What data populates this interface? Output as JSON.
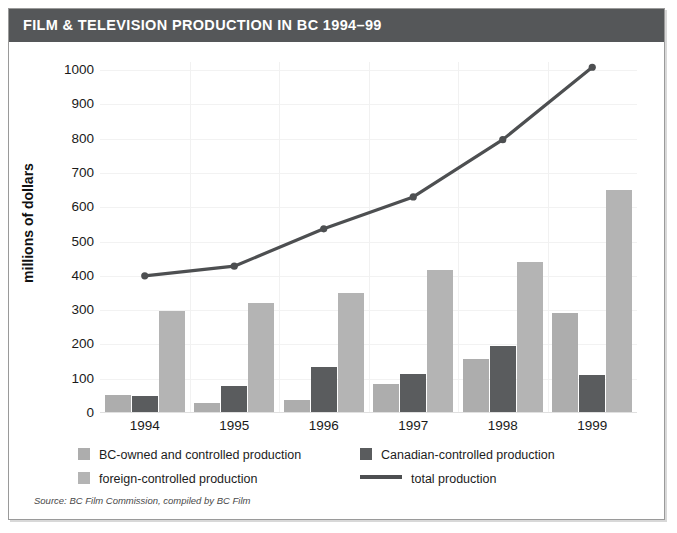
{
  "title": "FILM & TELEVISION PRODUCTION IN BC 1994–99",
  "source_note": "Source: BC Film Commission, compiled by BC Film",
  "colors": {
    "banner": "#555759",
    "banner_text": "#ffffff",
    "bc_owned": "#adadad",
    "canadian": "#5a5c5e",
    "foreign": "#b4b4b4",
    "total_line": "#4d4f51",
    "frame": "#9a9a9a",
    "gridline": "#f2f2f2"
  },
  "legend": {
    "items": [
      {
        "label": "BC-owned and controlled production",
        "type": "swatch",
        "color": "#adadad"
      },
      {
        "label": "Canadian-controlled production",
        "type": "swatch",
        "color": "#5a5c5e"
      },
      {
        "label": "foreign-controlled production",
        "type": "swatch",
        "color": "#b4b4b4"
      },
      {
        "label": "total production",
        "type": "line",
        "color": "#4d4f51"
      }
    ]
  },
  "chart_data": {
    "type": "bar",
    "title": "FILM & TELEVISION PRODUCTION IN BC 1994–99",
    "subtitle": "",
    "xlabel": "",
    "ylabel": "millions of dollars",
    "categories": [
      "1994",
      "1995",
      "1996",
      "1997",
      "1998",
      "1999"
    ],
    "ylim": [
      0,
      1000
    ],
    "yticks": [
      0,
      100,
      200,
      300,
      400,
      500,
      600,
      700,
      800,
      900,
      1000
    ],
    "ytick_labels": [
      "0",
      "100",
      "200",
      "300",
      "400",
      "500",
      "600",
      "700",
      "800",
      "900",
      "1000"
    ],
    "grid": true,
    "legend_position": "bottom",
    "series": [
      {
        "name": "BC-owned and controlled production",
        "kind": "bar",
        "color": "#adadad",
        "values": [
          52,
          30,
          38,
          85,
          158,
          292
        ]
      },
      {
        "name": "Canadian-controlled production",
        "kind": "bar",
        "color": "#5a5c5e",
        "values": [
          50,
          78,
          133,
          115,
          195,
          110
        ]
      },
      {
        "name": "foreign-controlled production",
        "kind": "bar",
        "color": "#b4b4b4",
        "values": [
          297,
          320,
          350,
          418,
          440,
          650
        ]
      },
      {
        "name": "total production",
        "kind": "line",
        "color": "#4d4f51",
        "values": [
          400,
          428,
          537,
          630,
          797,
          1008
        ]
      }
    ]
  }
}
